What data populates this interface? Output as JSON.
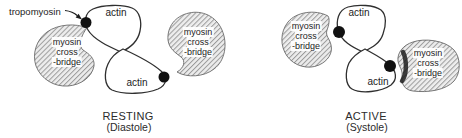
{
  "diagram": {
    "left_panel": {
      "state": "RESTING",
      "phase": "(Diastole)"
    },
    "right_panel": {
      "state": "ACTIVE",
      "phase": "(Systole)"
    },
    "labels": {
      "tropomyosin": "tropomyosin",
      "actin": "actin",
      "myosin_line1": "myosin",
      "myosin_line2": "cross",
      "myosin_line3": "-bridge"
    },
    "colors": {
      "outline": "#2f2f2f",
      "blob_outline": "#6a6a6a",
      "hatch_line": "#9b9b9b",
      "blob_fill": "#ededed",
      "dot": "#111111",
      "text": "#1d1d1d"
    }
  }
}
